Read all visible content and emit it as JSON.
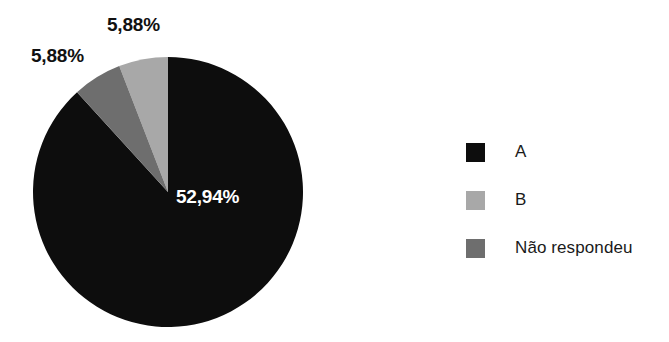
{
  "chart_data": {
    "type": "pie",
    "title": "",
    "subtitle": "",
    "xlabel": "",
    "ylabel": "",
    "legend_position": "right",
    "grid": false,
    "categories": [
      "A",
      "B",
      "Não respondeu"
    ],
    "values": [
      52.94,
      5.88,
      5.88
    ],
    "value_labels": [
      "52,94%",
      "5,88%",
      "5,88%"
    ],
    "colors": [
      "#0d0d0d",
      "#a8a8a8",
      "#6e6e6e"
    ],
    "slices": [
      {
        "name": "A",
        "value": 52.94,
        "label": "52,94%",
        "color": "#0d0d0d",
        "start_angle": 0,
        "sweep_angle": 317.64,
        "label_position": "inside"
      },
      {
        "name": "B",
        "value": 5.88,
        "label": "5,88%",
        "color": "#a8a8a8",
        "start_angle": 338.82,
        "sweep_angle": 21.18,
        "label_position": "outside"
      },
      {
        "name": "Não respondeu",
        "value": 5.88,
        "label": "5,88%",
        "color": "#6e6e6e",
        "start_angle": 317.64,
        "sweep_angle": 21.18,
        "label_position": "outside"
      }
    ],
    "legend": [
      {
        "label": "A",
        "color": "#0d0d0d"
      },
      {
        "label": "B",
        "color": "#a8a8a8"
      },
      {
        "label": "Não respondeu",
        "color": "#6e6e6e"
      }
    ]
  },
  "geometry": {
    "center_x": 168,
    "center_y": 192,
    "radius": 135
  }
}
